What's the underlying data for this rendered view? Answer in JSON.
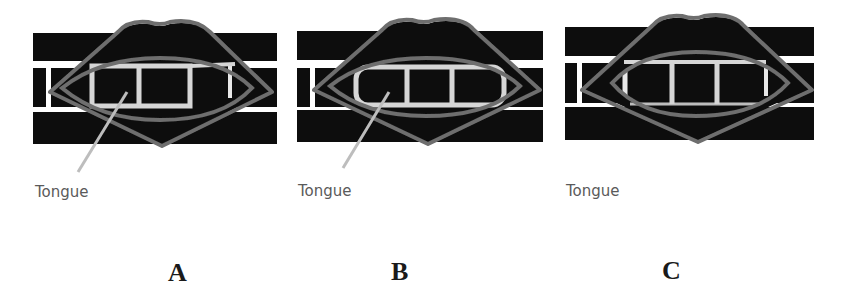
{
  "figure": {
    "panels": [
      {
        "letter": "A",
        "tongue_label": "Tongue"
      },
      {
        "letter": "B",
        "tongue_label": "Tongue"
      },
      {
        "letter": "C",
        "tongue_label": "Tongue"
      }
    ]
  },
  "colors": {
    "background": "#ffffff",
    "bars": "#0a0a0a",
    "lips_outline": "#6e6e6e",
    "teeth_frame": "#d6d6d6",
    "pointer": "#bdbdbd",
    "label_text": "#5a5a5a",
    "letter_text": "#1a1a1a"
  }
}
